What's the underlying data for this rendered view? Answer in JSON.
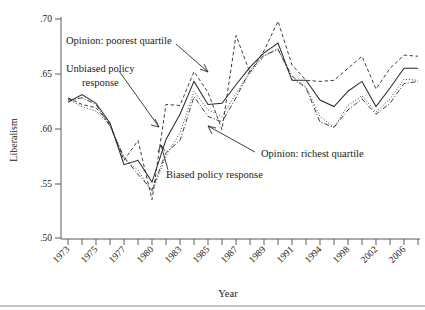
{
  "chart_data": {
    "type": "line",
    "title": "",
    "xlabel": "Year",
    "ylabel": "Liberalism",
    "ylim": [
      0.5,
      0.7
    ],
    "yticks": [
      ".50",
      ".55",
      ".60",
      ".65",
      ".70"
    ],
    "ytick_values": [
      0.5,
      0.55,
      0.6,
      0.65,
      0.7
    ],
    "grid": false,
    "legend_position": "none (inline annotations with arrows)",
    "x": [
      1973,
      1974,
      1975,
      1976,
      1977,
      1978,
      1980,
      1982,
      1983,
      1984,
      1985,
      1986,
      1987,
      1988,
      1989,
      1990,
      1991,
      1993,
      1994,
      1996,
      1998,
      2000,
      2002,
      2004,
      2006,
      2008
    ],
    "xticks": [
      "1973",
      "1975",
      "1977",
      "1980",
      "1983",
      "1985",
      "1987",
      "1989",
      "1991",
      "1994",
      "1998",
      "2002",
      "2006"
    ],
    "xtick_values": [
      1973,
      1975,
      1977,
      1980,
      1983,
      1985,
      1987,
      1989,
      1991,
      1994,
      1998,
      2002,
      2006
    ],
    "series": [
      {
        "name": "Opinion: poorest quartile",
        "style": "dashed",
        "values": [
          0.628,
          0.622,
          0.619,
          0.604,
          0.571,
          0.589,
          0.535,
          0.622,
          0.621,
          0.652,
          0.633,
          0.599,
          0.685,
          0.651,
          0.671,
          0.698,
          0.658,
          0.644,
          0.643,
          0.644,
          0.655,
          0.666,
          0.636,
          0.655,
          0.667,
          0.666
        ]
      },
      {
        "name": "Unbiased policy response",
        "style": "solid",
        "values": [
          0.624,
          0.631,
          0.623,
          0.605,
          0.567,
          0.571,
          0.551,
          0.59,
          0.613,
          0.643,
          0.622,
          0.623,
          0.64,
          0.656,
          0.669,
          0.678,
          0.644,
          0.644,
          0.626,
          0.62,
          0.634,
          0.643,
          0.62,
          0.637,
          0.655,
          0.655
        ]
      },
      {
        "name": "Biased policy response",
        "style": "dotted",
        "values": [
          0.627,
          0.62,
          0.616,
          0.603,
          0.572,
          0.562,
          0.542,
          0.575,
          0.596,
          0.634,
          0.617,
          0.611,
          0.632,
          0.651,
          0.666,
          0.673,
          0.645,
          0.638,
          0.611,
          0.601,
          0.621,
          0.63,
          0.615,
          0.627,
          0.645,
          0.644
        ]
      },
      {
        "name": "Opinion: richest quartile",
        "style": "dash-dot",
        "values": [
          0.626,
          0.628,
          0.622,
          0.602,
          0.574,
          0.558,
          0.544,
          0.578,
          0.589,
          0.629,
          0.611,
          0.606,
          0.628,
          0.653,
          0.667,
          0.672,
          0.648,
          0.637,
          0.606,
          0.601,
          0.617,
          0.627,
          0.613,
          0.623,
          0.641,
          0.643
        ]
      }
    ],
    "annotations": [
      {
        "text": "Opinion: poorest quartile",
        "points_to_series": "Opinion: poorest quartile"
      },
      {
        "text": "Unbiased policy",
        "points_to_series": "Unbiased policy response"
      },
      {
        "text": "response",
        "points_to_series": "Unbiased policy response"
      },
      {
        "text": "Biased policy response",
        "points_to_series": "Biased policy response"
      },
      {
        "text": "Opinion: richest quartile",
        "points_to_series": "Opinion: richest quartile"
      }
    ],
    "colors": {
      "line": "#2a2a2a",
      "axis": "#5a5a5a",
      "background": "#ffffff"
    }
  },
  "labels": {
    "y_axis_title": "Liberalism",
    "x_axis_title": "Year",
    "annot_poorest": "Opinion: poorest quartile",
    "annot_unbiased_line1": "Unbiased policy",
    "annot_unbiased_line2": "response",
    "annot_biased": "Biased policy response",
    "annot_richest": "Opinion: richest quartile",
    "ytick_0": ".70",
    "ytick_1": ".65",
    "ytick_2": ".60",
    "ytick_3": ".55",
    "ytick_4": ".50",
    "xtick_0": "1973",
    "xtick_1": "1975",
    "xtick_2": "1977",
    "xtick_3": "1980",
    "xtick_4": "1983",
    "xtick_5": "1985",
    "xtick_6": "1987",
    "xtick_7": "1989",
    "xtick_8": "1991",
    "xtick_9": "1994",
    "xtick_10": "1998",
    "xtick_11": "2002",
    "xtick_12": "2006"
  }
}
